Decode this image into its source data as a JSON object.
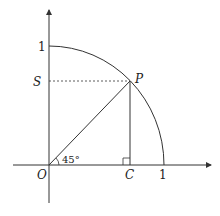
{
  "diagram": {
    "title": "",
    "labels": {
      "origin": "O",
      "point_p": "P",
      "point_s": "S",
      "point_c": "C",
      "x_one": "1",
      "y_one": "1",
      "angle": "45°"
    },
    "colors": {
      "stroke": "#333333",
      "text": "#222222",
      "background": "#ffffff"
    }
  }
}
